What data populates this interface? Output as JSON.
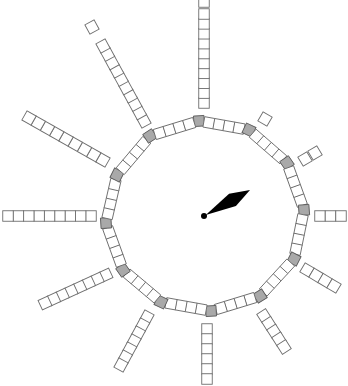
{
  "game": {
    "type": "circular-track-board-with-spinner",
    "cell_size": 10.5,
    "colors": {
      "background": "#ffffff",
      "cell_fill": "#ffffff",
      "cell_stroke": "#6e6e6e",
      "corner_fill": "#a9a9a9",
      "pointer": "#000000"
    },
    "ring": {
      "corner_squares": [
        [
          199,
          121
        ],
        [
          249,
          130
        ],
        [
          287,
          163
        ],
        [
          304,
          210
        ],
        [
          294,
          259
        ],
        [
          260,
          296
        ],
        [
          211,
          311
        ],
        [
          161,
          302
        ],
        [
          123,
          270
        ],
        [
          106,
          223
        ],
        [
          117,
          175
        ],
        [
          150,
          136
        ]
      ],
      "cells_between_corners": 4
    },
    "spokes": [
      {
        "name": "top",
        "start": [
          204,
          103
        ],
        "end": [
          204,
          14
        ],
        "count": 10,
        "detached": [
          204,
          2
        ]
      },
      {
        "name": "upper-right",
        "start": [
          265,
          119
        ],
        "end": [
          265,
          119
        ],
        "count": 1
      },
      {
        "name": "right-upper",
        "start": [
          305,
          159
        ],
        "end": [
          315,
          153
        ],
        "count": 2
      },
      {
        "name": "right",
        "start": [
          320,
          216
        ],
        "end": [
          341,
          216
        ],
        "count": 3
      },
      {
        "name": "right-lower",
        "start": [
          307,
          270
        ],
        "end": [
          334,
          286
        ],
        "count": 4
      },
      {
        "name": "lower-right",
        "start": [
          264,
          316
        ],
        "end": [
          284,
          347
        ],
        "count": 5
      },
      {
        "name": "bottom",
        "start": [
          207,
          329
        ],
        "end": [
          207,
          379
        ],
        "count": 6
      },
      {
        "name": "lower",
        "start": [
          147,
          317
        ],
        "end": [
          121,
          365
        ],
        "count": 7
      },
      {
        "name": "lower-left",
        "start": [
          106,
          275
        ],
        "end": [
          45,
          303
        ],
        "count": 8
      },
      {
        "name": "left",
        "start": [
          91,
          216
        ],
        "end": [
          8,
          216
        ],
        "count": 9
      },
      {
        "name": "left-upper",
        "start": [
          103,
          160
        ],
        "end": [
          29,
          118
        ],
        "count": 9
      },
      {
        "name": "upper-left",
        "start": [
          144,
          121
        ],
        "end": [
          103,
          46
        ],
        "count": 10,
        "detached": [
          92,
          27
        ]
      }
    ],
    "spinner": {
      "pivot": [
        204,
        216
      ],
      "pivot_radius": 3,
      "tip": [
        250,
        190
      ],
      "label": "spinner-pointer"
    }
  }
}
